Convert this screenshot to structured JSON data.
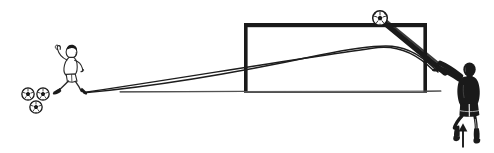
{
  "figure": {
    "title": "Chipped shot over the goalkeeper into the goal",
    "style": "black-and-white line illustration",
    "background_color": "#ffffff",
    "ink_color": "#1a1a1a",
    "width": 494,
    "height": 153
  },
  "ground": {
    "label": "ground line",
    "color": "#3a3a3a",
    "x_start": 120,
    "x_end": 441,
    "y": 91
  },
  "goal": {
    "label": "soccer goal",
    "color": "#1a1a1a",
    "left_post_x": 245,
    "right_post_x": 425,
    "crossbar_y": 25,
    "base_y": 92,
    "bar_thickness": 4
  },
  "kicker": {
    "label": "kicker",
    "description": "player striking the ball, outline drawing, dark hair, white kit, black boots",
    "x": 70,
    "y": 68,
    "hair_color": "#1a1a1a",
    "kit_color": "#ffffff",
    "boot_color": "#1a1a1a"
  },
  "balls_at_feet": {
    "label": "soccer balls at kicker's feet",
    "count": 3,
    "radius": 6.5,
    "positions": [
      {
        "cx": 28,
        "cy": 94
      },
      {
        "cx": 43,
        "cy": 94
      },
      {
        "cx": 36,
        "cy": 107
      }
    ]
  },
  "ball_in_flight": {
    "label": "ball above the crossbar",
    "cx": 380,
    "cy": 18,
    "radius": 7.5
  },
  "goalkeeper": {
    "label": "goalkeeper",
    "description": "goalkeeper jumping with both arms stretched upward, solid black jersey and shorts",
    "x": 438,
    "y": 60,
    "jersey_color": "#1a1a1a",
    "skin_color": "#ffffff"
  },
  "arrow": {
    "label": "upward jump arrow",
    "direction": "up",
    "x": 463,
    "y_tail": 147,
    "y_head": 124,
    "color": "#1a1a1a"
  },
  "trajectories": [
    {
      "name": "straight-line-path",
      "label": "low driven line from kicker toward goal",
      "style": "thin solid",
      "points": "85,92 250,68 380,47 432,70"
    },
    {
      "name": "chip-arc-path",
      "label": "chipped ball arc rising over the goalkeeper and dipping into the goal",
      "style": "thin solid curve",
      "points": "85,92 200,80 330,52 388,46 420,58 438,72"
    }
  ],
  "keeper_arm_line": {
    "label": "goalkeeper reaching arm toward the ball",
    "style": "thick solid",
    "from_x": 383,
    "from_y": 22,
    "to_x": 444,
    "to_y": 72,
    "thickness": 5
  }
}
